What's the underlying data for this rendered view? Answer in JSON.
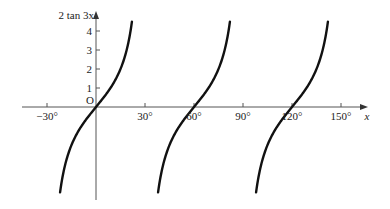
{
  "chart_data": {
    "type": "line",
    "title": "",
    "function": "y = 2 tan 3x",
    "xlabel": "x",
    "ylabel": "2 tan 3x",
    "origin_label": "O",
    "x_ticks": [
      -30,
      30,
      60,
      90,
      120,
      150
    ],
    "x_tick_labels": [
      "−30°",
      "30°",
      "60°",
      "90°",
      "120°",
      "150°"
    ],
    "y_ticks": [
      1,
      2,
      3,
      4
    ],
    "y_tick_labels": [
      "1",
      "2",
      "3",
      "4"
    ],
    "xlim": [
      -40,
      165
    ],
    "ylim": [
      -4.8,
      4.8
    ],
    "grid": false,
    "legend": null,
    "series": [
      {
        "name": "branch-1",
        "x_range": [
          -22,
          22
        ],
        "center": 0
      },
      {
        "name": "branch-2",
        "x_range": [
          38,
          82
        ],
        "center": 60
      },
      {
        "name": "branch-3",
        "x_range": [
          98,
          142
        ],
        "center": 120
      }
    ],
    "curve_color": "#111111",
    "axis_color": "#555555"
  }
}
